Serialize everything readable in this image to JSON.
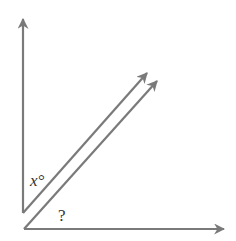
{
  "diagram": {
    "type": "geometry-angles",
    "stroke_color": "#7a7a7a",
    "labels": {
      "angle_x": "x°",
      "angle_unknown": "?"
    },
    "rays": [
      {
        "name": "vertical-ray",
        "from": [
          23,
          213
        ],
        "to": [
          23,
          18
        ]
      },
      {
        "name": "upper-diagonal-ray",
        "from": [
          23,
          213
        ],
        "to": [
          148,
          72
        ]
      },
      {
        "name": "lower-diagonal-ray",
        "from": [
          24,
          229
        ],
        "to": [
          158,
          80
        ]
      },
      {
        "name": "horizontal-ray",
        "from": [
          24,
          229
        ],
        "to": [
          225,
          229
        ]
      }
    ],
    "parallel_lines": [
      "upper-diagonal-ray",
      "lower-diagonal-ray"
    ]
  }
}
